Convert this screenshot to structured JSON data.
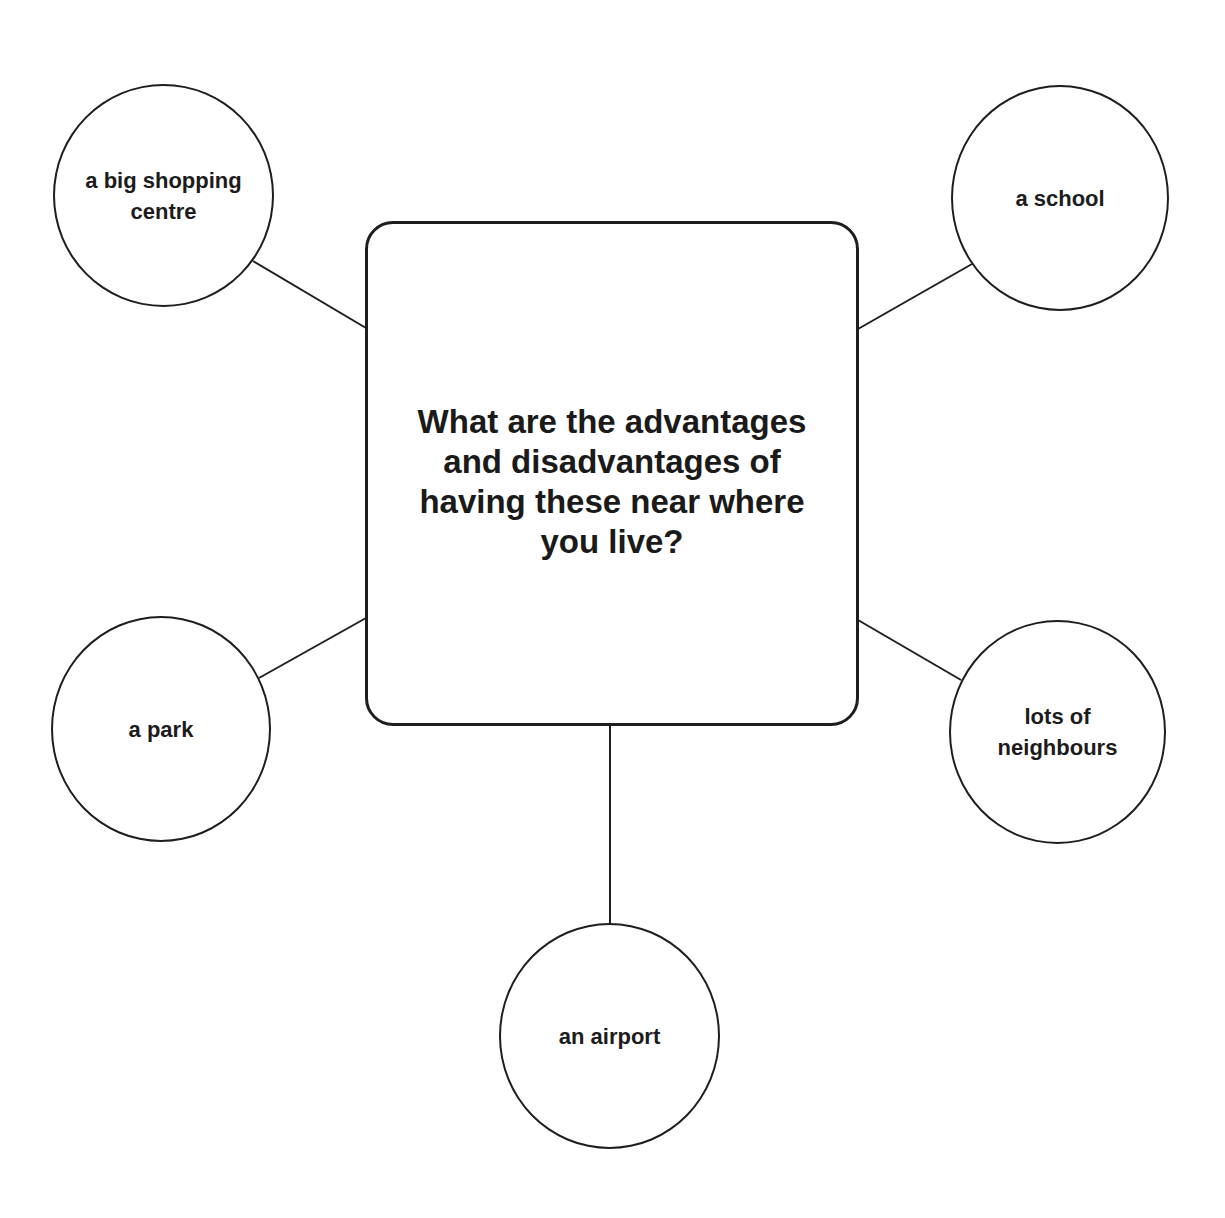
{
  "diagram": {
    "type": "mind-map",
    "center": {
      "question": "What are the advantages and disadvantages of having these near where you live?"
    },
    "nodes": [
      {
        "id": "shopping-centre",
        "label": "a big shopping centre",
        "position": "top-left"
      },
      {
        "id": "school",
        "label": "a school",
        "position": "top-right"
      },
      {
        "id": "park",
        "label": "a park",
        "position": "bottom-left"
      },
      {
        "id": "neighbours",
        "label": "lots of neighbours",
        "position": "bottom-right"
      },
      {
        "id": "airport",
        "label": "an airport",
        "position": "bottom"
      }
    ],
    "colors": {
      "stroke": "#1e1e1e",
      "text": "#1a1a1a",
      "background": "#ffffff"
    }
  }
}
